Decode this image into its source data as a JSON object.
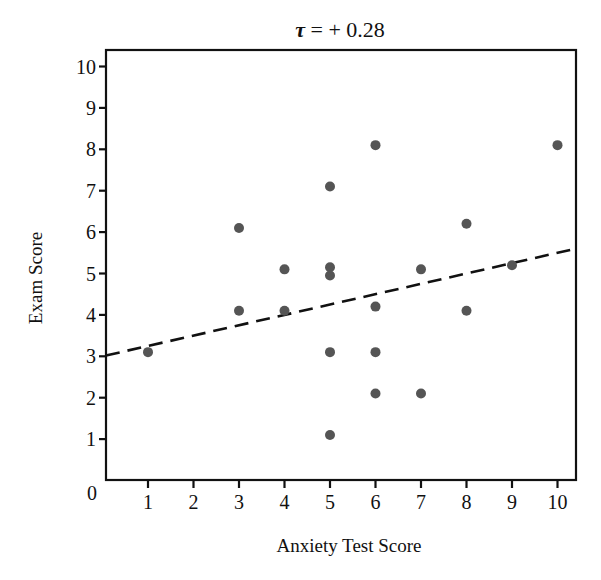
{
  "chart_data": {
    "type": "scatter",
    "title": "τ = + 0.28",
    "title_parts": {
      "symbol": "τ",
      "rest": " = + 0.28"
    },
    "xlabel": "Anxiety Test Score",
    "ylabel": "Exam Score",
    "xlim": [
      0,
      10.4
    ],
    "ylim": [
      0,
      10.4
    ],
    "x_ticks": [
      "1",
      "2",
      "3",
      "4",
      "5",
      "6",
      "7",
      "8",
      "9",
      "10"
    ],
    "y_ticks": [
      "1",
      "2",
      "3",
      "4",
      "5",
      "6",
      "7",
      "8",
      "9",
      "10"
    ],
    "origin_label": "0",
    "grid": false,
    "legend": null,
    "series": [
      {
        "name": "observations",
        "marker": "circle",
        "color": "#555555",
        "points": [
          {
            "x": 1,
            "y": 3.1
          },
          {
            "x": 3,
            "y": 6.1
          },
          {
            "x": 3,
            "y": 4.1
          },
          {
            "x": 4,
            "y": 5.1
          },
          {
            "x": 4,
            "y": 4.1
          },
          {
            "x": 5,
            "y": 7.1
          },
          {
            "x": 5,
            "y": 5.15
          },
          {
            "x": 5,
            "y": 4.95
          },
          {
            "x": 5,
            "y": 3.1
          },
          {
            "x": 5,
            "y": 1.1
          },
          {
            "x": 6,
            "y": 8.1
          },
          {
            "x": 6,
            "y": 4.2
          },
          {
            "x": 6,
            "y": 3.1
          },
          {
            "x": 6,
            "y": 2.1
          },
          {
            "x": 7,
            "y": 5.1
          },
          {
            "x": 7,
            "y": 2.1
          },
          {
            "x": 8,
            "y": 6.2
          },
          {
            "x": 8,
            "y": 4.1
          },
          {
            "x": 9,
            "y": 5.2
          },
          {
            "x": 10,
            "y": 8.1
          }
        ]
      }
    ],
    "trend_line": {
      "style": "dashed",
      "color": "#111111",
      "from": {
        "x": 0,
        "y": 3.0
      },
      "to": {
        "x": 10.4,
        "y": 5.6
      }
    }
  }
}
